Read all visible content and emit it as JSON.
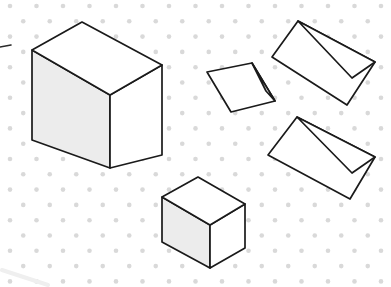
{
  "canvas": {
    "width": 391,
    "height": 287,
    "background_color": "#ffffff",
    "title": "Isometric dot paper with five drawn solids"
  },
  "grid": {
    "name": "isometric-dot-grid",
    "dot_color": "#d9d9d9",
    "dot_radius": 2.3,
    "column_spacing": 26.5,
    "row_spacing": 15.3,
    "x_origin": 10,
    "y_origin": 6,
    "columns": 16,
    "rows": 20,
    "pattern": "staggered-triangular"
  },
  "style": {
    "stroke_color": "#1a1a1a",
    "stroke_width": 1.7,
    "top_face_fill": "#ffffff",
    "left_face_fill": "#ececec",
    "right_face_fill": "#ffffff",
    "end_face_fill": "#ffffff",
    "smudge_color": "#f0f0f0"
  },
  "shapes": [
    {
      "id": "large-rectangular-prism",
      "label": "Large rectangular prism",
      "type": "rectangular-prism",
      "faces": {
        "top": "32,50 82,22 162,65 110,95",
        "left": "32,50 110,95 110,168 32,140",
        "right": "110,95 162,65 162,155 110,168"
      },
      "fills": {
        "top": "#ffffff",
        "left": "#ececec",
        "right": "#ffffff"
      },
      "vertices": {
        "top_left": [
          32,
          50
        ],
        "top_back": [
          82,
          22
        ],
        "top_right": [
          162,
          65
        ],
        "top_front": [
          110,
          95
        ],
        "bottom_left": [
          32,
          140
        ],
        "bottom_front": [
          110,
          168
        ],
        "bottom_right": [
          162,
          155
        ]
      }
    },
    {
      "id": "small-rectangular-prism",
      "label": "Small rectangular prism",
      "type": "rectangular-prism",
      "faces": {
        "top": "162,197 198,177 245,204 210,225",
        "left": "162,197 210,225 210,268 162,242",
        "right": "210,225 245,204 245,248 210,268"
      },
      "fills": {
        "top": "#ffffff",
        "left": "#ececec",
        "right": "#ffffff"
      },
      "vertices": {
        "top_left": [
          162,
          197
        ],
        "top_back": [
          198,
          177
        ],
        "top_right": [
          245,
          204
        ],
        "top_front": [
          210,
          225
        ],
        "bottom_left": [
          162,
          242
        ],
        "bottom_front": [
          210,
          268
        ],
        "bottom_right": [
          245,
          248
        ]
      }
    },
    {
      "id": "triangular-prism-small-left",
      "label": "Small triangular prism",
      "type": "triangular-prism",
      "faces": {
        "slant": "207,72 252,63 275,101 231,112",
        "end": "252,63 275,101 266,91"
      },
      "fills": {
        "slant": "#ffffff",
        "end": "#ffffff"
      },
      "vertices": {
        "apex_back": [
          207,
          72
        ],
        "apex_front": [
          252,
          63
        ],
        "base_front": [
          275,
          101
        ],
        "base_back": [
          231,
          112
        ],
        "ridge_end": [
          266,
          91
        ]
      }
    },
    {
      "id": "triangular-prism-top-right",
      "label": "Upper right triangular prism",
      "type": "triangular-prism",
      "faces": {
        "slant": "272,57 298,21 375,62 347,105",
        "end": "298,21 375,62 352,78"
      },
      "fills": {
        "slant": "#ffffff",
        "end": "#ffffff"
      },
      "vertices": {
        "ridge_back": [
          272,
          57
        ],
        "ridge_front": [
          298,
          21
        ],
        "base_front": [
          375,
          62
        ],
        "base_back": [
          347,
          105
        ],
        "apex_end": [
          352,
          78
        ]
      }
    },
    {
      "id": "triangular-prism-lower-right",
      "label": "Lower right triangular prism",
      "type": "triangular-prism",
      "faces": {
        "slant": "268,155 297,117 375,157 350,199",
        "end": "297,117 375,157 352,173"
      },
      "fills": {
        "slant": "#ffffff",
        "end": "#ffffff"
      },
      "vertices": {
        "ridge_back": [
          268,
          155
        ],
        "ridge_front": [
          297,
          117
        ],
        "base_front": [
          375,
          157
        ],
        "base_back": [
          350,
          199
        ],
        "apex_end": [
          352,
          173
        ]
      }
    }
  ],
  "artifacts": [
    {
      "id": "left-edge-mark",
      "label": "Stray pencil mark at left edge",
      "path": "M0,47 L11,45",
      "color": "#2a2a2a",
      "width": 1.6
    },
    {
      "id": "bottom-left-smudge",
      "label": "Faint smudge bottom left",
      "path": "M2,270 L48,285",
      "color": "#efefef",
      "width": 4
    }
  ]
}
